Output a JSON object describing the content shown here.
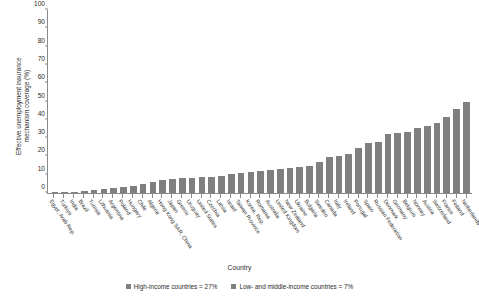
{
  "chart": {
    "type": "bar",
    "ylabel_line1": "Effective unemployment insurance",
    "ylabel_line2": "mechanism coverage (%)",
    "xlabel": "Country",
    "bar_color": "#7f7f7f",
    "axis_color": "#8a8a8a"
  },
  "legend": {
    "items": [
      {
        "label": "High-income countries = 27%",
        "color": "#7f7f7f"
      },
      {
        "label": "Low- and middle-income countries = 7%",
        "color": "#7f7f7f"
      }
    ]
  },
  "chart_data": {
    "type": "bar",
    "title": "",
    "xlabel": "Country",
    "ylabel": "Effective unemployment insurance mechanism coverage (%)",
    "ylim": [
      0,
      100
    ],
    "yticks": [
      0,
      10,
      20,
      30,
      40,
      50,
      60,
      70,
      80,
      90,
      100
    ],
    "ytick_labels": [
      "0",
      "10",
      "20",
      "30",
      "40",
      "50",
      "60",
      "70",
      "80",
      "90",
      "100"
    ],
    "grid": false,
    "legend_position": "bottom-center",
    "series_color": "#7f7f7f",
    "categories": [
      "Egypt, Arab Rep.",
      "Türkiye",
      "India",
      "Brazil",
      "Tunisia",
      "Lithuania",
      "Argentina",
      "Poland",
      "Hungary",
      "Chile",
      "Algeria",
      "Hong Kong SAR, China",
      "Japan",
      "Greece",
      "Uruguay",
      "United States",
      "Czechia",
      "Latvia",
      "Israel",
      "Taiwan Province",
      "Korea, Rep.",
      "Romania",
      "Australia",
      "United Kingdom",
      "New Zealand",
      "Ukraine",
      "Bulgaria",
      "Sweden",
      "Canada",
      "Italy",
      "Ireland",
      "Portugal",
      "Spain",
      "Russian Federation",
      "Denmark",
      "Germany",
      "Belgium",
      "Norway",
      "Austria",
      "Switzerland",
      "France",
      "Finland",
      "Netherlands"
    ],
    "values": [
      0.3,
      0.5,
      0.7,
      1.0,
      1.5,
      2.0,
      2.5,
      3.5,
      3.7,
      5.0,
      6.0,
      7.0,
      7.5,
      8.0,
      8.0,
      8.5,
      9.0,
      9.5,
      10.5,
      11.0,
      11.5,
      12.0,
      12.5,
      13.0,
      13.5,
      14.0,
      15.0,
      17.0,
      19.5,
      20.0,
      21.5,
      24.5,
      27.5,
      28.0,
      32.0,
      33.0,
      33.5,
      35.5,
      36.5,
      38.0,
      41.5,
      46.0,
      49.5
    ],
    "ylabel_unit": "%",
    "annotations": [
      "High-income countries = 27%",
      "Low- and middle-income countries = 7%"
    ]
  }
}
